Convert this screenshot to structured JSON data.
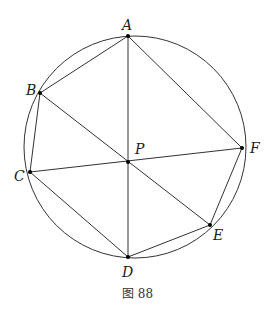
{
  "figure": {
    "caption": "图 88",
    "circle": {
      "cx": 135,
      "cy": 147,
      "r": 111
    },
    "points": {
      "A": {
        "label": "A",
        "x": 128,
        "y": 36
      },
      "B": {
        "label": "B",
        "x": 40,
        "y": 93
      },
      "C": {
        "label": "C",
        "x": 30,
        "y": 172
      },
      "D": {
        "label": "D",
        "x": 128,
        "y": 257
      },
      "E": {
        "label": "E",
        "x": 210,
        "y": 225
      },
      "F": {
        "label": "F",
        "x": 242,
        "y": 148
      },
      "P": {
        "label": "P",
        "x": 128,
        "y": 162
      }
    },
    "segments": [
      "AB",
      "BC",
      "CD",
      "DE",
      "EF",
      "FA",
      "AD",
      "BE",
      "CF"
    ]
  }
}
